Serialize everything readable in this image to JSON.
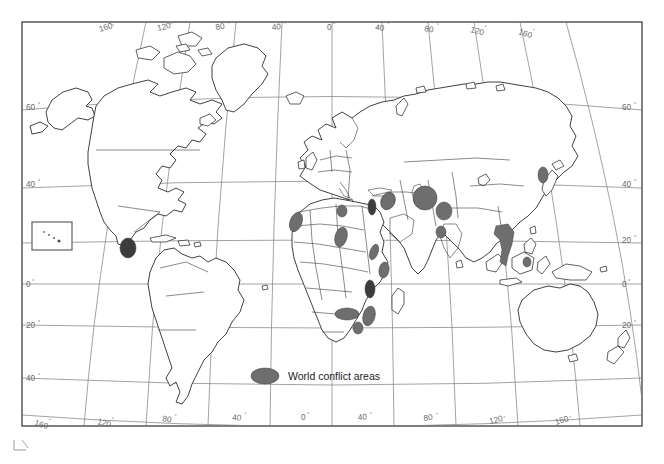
{
  "map": {
    "kind": "world-map",
    "projection": "curved-graticule-world",
    "legend": {
      "marker_name": "conflict-area-marker",
      "label": "World conflict areas",
      "marker_color": "#6e6e6e",
      "marker_stroke": "#3a3a3a"
    },
    "colors": {
      "conflict_fill": "#6e6e6e",
      "conflict_fill_dark": "#3c3c3c",
      "coastline": "#2b2b2b",
      "country_border": "#3c3c3c",
      "graticule": "#7b7b7b",
      "frame": "#4a4a4a",
      "label_text": "#6a6a6a",
      "legend_text": "#1b1b1b",
      "background": "#ffffff"
    },
    "graticule": {
      "longitude_labels_top": [
        "160",
        "120",
        "80",
        "40",
        "0",
        "40",
        "80",
        "120",
        "160"
      ],
      "longitude_labels_bottom": [
        "160",
        "120",
        "80",
        "40",
        "0",
        "40",
        "80",
        "120",
        "160"
      ],
      "latitude_labels_left": [
        "60",
        "40",
        "20",
        "0",
        "20",
        "40"
      ],
      "latitude_labels_right": [
        "60",
        "40",
        "20",
        "0",
        "20"
      ],
      "degree_symbol": "°"
    },
    "inset": {
      "name": "hawaii-inset",
      "label": ""
    },
    "conflict_areas": [
      {
        "name": "central-america",
        "cx": 128,
        "cy": 248,
        "rx": 8,
        "ry": 10,
        "rot": 0,
        "shade": "dark"
      },
      {
        "name": "western-sahara-mauritania",
        "cx": 296,
        "cy": 222,
        "rx": 6,
        "ry": 10,
        "rot": 20
      },
      {
        "name": "algeria",
        "cx": 342,
        "cy": 211,
        "rx": 5,
        "ry": 6,
        "rot": 0
      },
      {
        "name": "libya-chad",
        "cx": 341,
        "cy": 237,
        "rx": 6,
        "ry": 10,
        "rot": 15
      },
      {
        "name": "israel-lebanon",
        "cx": 372,
        "cy": 207,
        "rx": 4,
        "ry": 8,
        "rot": 0,
        "shade": "dark"
      },
      {
        "name": "turkey-kurdistan",
        "cx": 388,
        "cy": 201,
        "rx": 7,
        "ry": 9,
        "rot": 25
      },
      {
        "name": "iraq-iran",
        "cx": 425,
        "cy": 198,
        "rx": 12,
        "ry": 12,
        "rot": 0
      },
      {
        "name": "afghanistan",
        "cx": 444,
        "cy": 211,
        "rx": 8,
        "ry": 9,
        "rot": 0
      },
      {
        "name": "kashmir",
        "cx": 441,
        "cy": 232,
        "rx": 5,
        "ry": 6,
        "rot": 0
      },
      {
        "name": "sudan-eritrea",
        "cx": 374,
        "cy": 252,
        "rx": 4,
        "ry": 8,
        "rot": 20
      },
      {
        "name": "somalia-ethiopia",
        "cx": 384,
        "cy": 270,
        "rx": 5,
        "ry": 8,
        "rot": 10
      },
      {
        "name": "great-lakes-rwanda",
        "cx": 370,
        "cy": 289,
        "rx": 5,
        "ry": 9,
        "rot": 0,
        "shade": "dark"
      },
      {
        "name": "angola",
        "cx": 347,
        "cy": 314,
        "rx": 12,
        "ry": 6,
        "rot": 0
      },
      {
        "name": "mozambique",
        "cx": 369,
        "cy": 316,
        "rx": 6,
        "ry": 10,
        "rot": 15
      },
      {
        "name": "zimbabwe-botswana",
        "cx": 358,
        "cy": 328,
        "rx": 5,
        "ry": 6,
        "rot": 0
      },
      {
        "name": "indochina-vietnam",
        "cx": 504,
        "cy": 243,
        "rx": 10,
        "ry": 18,
        "rot": 12
      },
      {
        "name": "korea",
        "cx": 543,
        "cy": 175,
        "rx": 5,
        "ry": 8,
        "rot": 0
      },
      {
        "name": "philippines-mindanao",
        "cx": 527,
        "cy": 262,
        "rx": 4,
        "ry": 5,
        "rot": 0
      }
    ]
  }
}
